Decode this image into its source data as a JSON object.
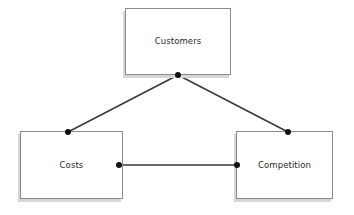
{
  "diagram": {
    "type": "triangle-relationship",
    "canvas": {
      "width": 354,
      "height": 215
    },
    "background_color": "#ffffff",
    "node_fill": "#ffffff",
    "node_border_color": "#8b8b8b",
    "node_shadow_color": "#d6d6d6",
    "edge_color": "#3a3a3a",
    "dot_color": "#111111",
    "label_color": "#2b2b2b",
    "nodes": [
      {
        "id": "customers",
        "label": "Customers",
        "x": 125,
        "y": 8,
        "width": 106,
        "height": 67
      },
      {
        "id": "costs",
        "label": "Costs",
        "x": 20,
        "y": 131,
        "width": 103,
        "height": 68
      },
      {
        "id": "competition",
        "label": "Competition",
        "x": 236,
        "y": 131,
        "width": 97,
        "height": 68
      }
    ],
    "edges": [
      {
        "id": "customers-costs",
        "from": "customers",
        "to": "costs",
        "x1": 178,
        "y1": 75,
        "x2": 68,
        "y2": 132
      },
      {
        "id": "customers-competition",
        "from": "customers",
        "to": "competition",
        "x1": 178,
        "y1": 75,
        "x2": 288,
        "y2": 132
      },
      {
        "id": "costs-competition",
        "from": "costs",
        "to": "competition",
        "x1": 119,
        "y1": 165,
        "x2": 237,
        "y2": 165
      }
    ],
    "junction_dots": [
      {
        "id": "dot-customers-bottom",
        "x": 178,
        "y": 75
      },
      {
        "id": "dot-costs-top",
        "x": 68,
        "y": 132
      },
      {
        "id": "dot-competition-top",
        "x": 288,
        "y": 132
      },
      {
        "id": "dot-costs-right",
        "x": 119,
        "y": 165
      },
      {
        "id": "dot-competition-left",
        "x": 237,
        "y": 165
      }
    ]
  }
}
